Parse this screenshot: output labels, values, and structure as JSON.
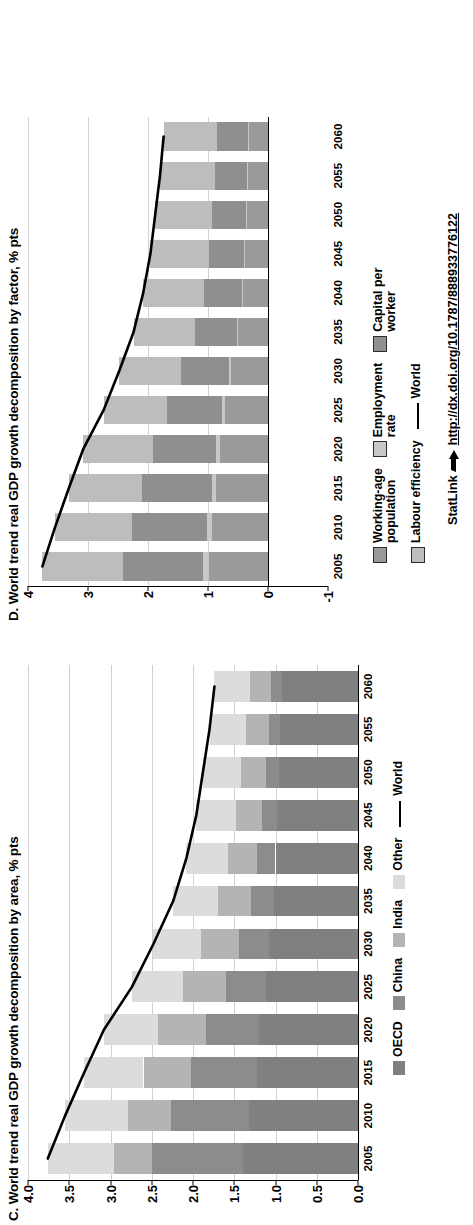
{
  "figure": {
    "statlink_label": "StatLink",
    "statlink_url": "http://dx.doi.org/10.1787/888933776122",
    "statlink_icon": "statlink-arrow-icon"
  },
  "colors": {
    "oecd": "#808080",
    "briics": "#a8a8a8",
    "china": "#8c8c8c",
    "india": "#b4b4b4",
    "other": "#dcdcdc",
    "working_age": "#9a9a9a",
    "employment_rate": "#c8c8c8",
    "capital_per_worker": "#8f8f8f",
    "labour_efficiency": "#bdbdbd",
    "world_line": "#000000",
    "grid": "#d2d2d2"
  },
  "panelC": {
    "title": "C. World trend real GDP growth decomposition by area, % pts",
    "legend": [
      {
        "label": "OECD",
        "swatch": "oecd"
      },
      {
        "label": "China",
        "swatch": "china"
      },
      {
        "label": "India",
        "swatch": "india"
      },
      {
        "label": "Other",
        "swatch": "other"
      },
      {
        "label": "World",
        "swatch": "line"
      }
    ]
  },
  "panelD": {
    "title": "D. World trend real GDP growth decomposition by factor, % pts",
    "legend_row1": [
      {
        "label": "Working-age\npopulation",
        "swatch": "working_age"
      },
      {
        "label": "Employment\nrate",
        "swatch": "employment_rate"
      },
      {
        "label": "Capital per\nworker",
        "swatch": "capital_per_worker"
      }
    ],
    "legend_row2": [
      {
        "label": "Labour efficiency",
        "swatch": "labour_efficiency"
      },
      {
        "label": "World",
        "swatch": "line"
      }
    ]
  },
  "chart_data": [
    {
      "id": "panelC",
      "type": "bar",
      "title": "C. World trend real GDP growth decomposition by area, % pts",
      "xlabel": "",
      "ylabel": "% pts",
      "ylim": [
        0.0,
        4.0
      ],
      "yticks": [
        "0.0",
        "0.5",
        "1.0",
        "1.5",
        "2.0",
        "2.5",
        "3.0",
        "3.5",
        "4.0"
      ],
      "ytick_values": [
        0.0,
        0.5,
        1.0,
        1.5,
        2.0,
        2.5,
        3.0,
        3.5,
        4.0
      ],
      "grid": true,
      "stacked": true,
      "legend_position": "bottom",
      "categories": [
        2005,
        2010,
        2015,
        2020,
        2025,
        2030,
        2035,
        2040,
        2045,
        2050,
        2055,
        2060
      ],
      "xtick_labels": [
        "2005",
        "2010",
        "2015",
        "2020",
        "2025",
        "2030",
        "2035",
        "2040",
        "2045",
        "2050",
        "2055",
        "2060"
      ],
      "series": [
        {
          "name": "OECD",
          "color": "#808080",
          "values": [
            1.4,
            1.32,
            1.22,
            1.2,
            1.12,
            1.08,
            1.02,
            1.0,
            0.98,
            0.96,
            0.94,
            0.92
          ]
        },
        {
          "name": "China",
          "color": "#8c8c8c",
          "values": [
            1.1,
            0.95,
            0.8,
            0.64,
            0.48,
            0.36,
            0.28,
            0.22,
            0.18,
            0.16,
            0.14,
            0.13
          ]
        },
        {
          "name": "India",
          "color": "#b4b4b4",
          "values": [
            0.46,
            0.52,
            0.58,
            0.58,
            0.52,
            0.46,
            0.4,
            0.36,
            0.32,
            0.3,
            0.28,
            0.26
          ]
        },
        {
          "name": "Other",
          "color": "#dcdcdc",
          "values": [
            0.8,
            0.76,
            0.72,
            0.66,
            0.62,
            0.58,
            0.54,
            0.5,
            0.48,
            0.46,
            0.44,
            0.43
          ]
        }
      ],
      "line_series": {
        "name": "World",
        "color": "#000000",
        "values": [
          3.76,
          3.55,
          3.32,
          3.08,
          2.74,
          2.48,
          2.24,
          2.08,
          1.96,
          1.88,
          1.8,
          1.74
        ]
      }
    },
    {
      "id": "panelD",
      "type": "bar",
      "title": "D. World trend real GDP growth decomposition by factor, % pts",
      "xlabel": "",
      "ylabel": "% pts",
      "ylim": [
        -1,
        4
      ],
      "yticks": [
        "-1",
        "0",
        "1",
        "2",
        "3",
        "4"
      ],
      "ytick_values": [
        -1,
        0,
        1,
        2,
        3,
        4
      ],
      "grid": true,
      "stacked": true,
      "legend_position": "bottom",
      "categories": [
        2005,
        2010,
        2015,
        2020,
        2025,
        2030,
        2035,
        2040,
        2045,
        2050,
        2055,
        2060
      ],
      "xtick_labels": [
        "2005",
        "2010",
        "2015",
        "2020",
        "2025",
        "2030",
        "2035",
        "2040",
        "2045",
        "2050",
        "2055",
        "2060"
      ],
      "series": [
        {
          "name": "Working-age population",
          "color": "#9a9a9a",
          "values": [
            0.98,
            0.93,
            0.86,
            0.8,
            0.72,
            0.62,
            0.5,
            0.42,
            0.38,
            0.36,
            0.34,
            0.32
          ]
        },
        {
          "name": "Employment rate",
          "color": "#c8c8c8",
          "values": [
            0.1,
            0.09,
            0.08,
            0.06,
            0.04,
            0.03,
            0.02,
            0.02,
            0.02,
            0.01,
            0.01,
            0.01
          ]
        },
        {
          "name": "Capital per worker",
          "color": "#8f8f8f",
          "values": [
            1.34,
            1.24,
            1.16,
            1.06,
            0.92,
            0.8,
            0.7,
            0.62,
            0.58,
            0.56,
            0.54,
            0.52
          ]
        },
        {
          "name": "Labour efficiency",
          "color": "#bdbdbd",
          "values": [
            1.34,
            1.29,
            1.22,
            1.16,
            1.06,
            1.03,
            1.02,
            1.02,
            0.98,
            0.95,
            0.91,
            0.89
          ]
        }
      ],
      "line_series": {
        "name": "World",
        "color": "#000000",
        "values": [
          3.76,
          3.55,
          3.32,
          3.08,
          2.74,
          2.48,
          2.24,
          2.08,
          1.96,
          1.88,
          1.8,
          1.74
        ]
      }
    }
  ]
}
